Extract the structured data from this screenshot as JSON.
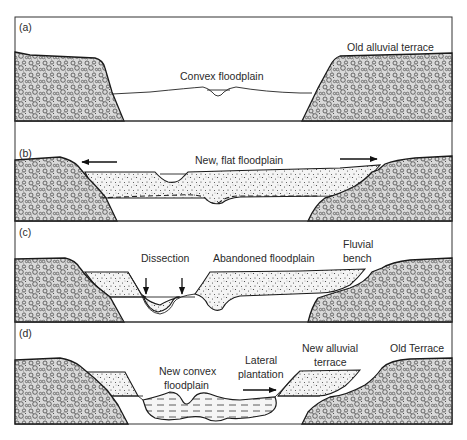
{
  "figure": {
    "panels": [
      {
        "id": "a",
        "label": "(a)",
        "annotations": {
          "floodplain": "Convex floodplain",
          "terrace": "Old alluvial terrace"
        }
      },
      {
        "id": "b",
        "label": "(b)",
        "annotations": {
          "floodplain": "New, flat floodplain"
        },
        "arrows": [
          "left",
          "right"
        ]
      },
      {
        "id": "c",
        "label": "(c)",
        "annotations": {
          "dissection": "Dissection",
          "abandoned": "Abandoned floodplain",
          "bench_line1": "Fluvial",
          "bench_line2": "bench"
        },
        "arrows": [
          "down",
          "down"
        ]
      },
      {
        "id": "d",
        "label": "(d)",
        "annotations": {
          "convex_line1": "New convex",
          "convex_line2": "floodplain",
          "lateral_line1": "Lateral",
          "lateral_line2": "plantation",
          "new_terrace_line1": "New alluvial",
          "new_terrace_line2": "terrace",
          "old_terrace": "Old Terrace"
        },
        "arrows": [
          "right"
        ]
      }
    ],
    "legend_materials": [
      "gravel bedrock",
      "sandy alluvium",
      "fine floodplain deposits"
    ]
  }
}
